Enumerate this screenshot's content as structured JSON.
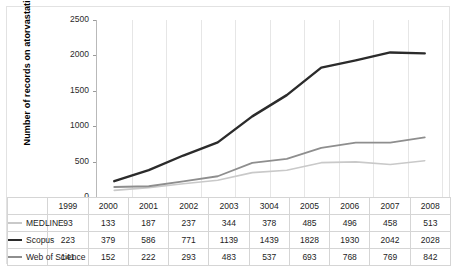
{
  "figure": {
    "background": "#ffffff",
    "border_color": "#e2e2e2"
  },
  "chart_data": {
    "type": "line",
    "title": "",
    "xlabel": "",
    "ylabel": "Number of records on atorvastatin",
    "categories": [
      "1999",
      "2000",
      "2001",
      "2002",
      "2003",
      "3004",
      "2005",
      "2006",
      "2007",
      "2008"
    ],
    "ylim": [
      0,
      2500
    ],
    "yticks": [
      0,
      500,
      1000,
      1500,
      2000,
      2500
    ],
    "ytick_labels": [
      "0",
      "500",
      "1000",
      "1500",
      "2000",
      "2500"
    ],
    "grid": false,
    "legend_position": "data-table-keys-left",
    "series": [
      {
        "name": "MEDLINE",
        "color": "#c9c9c9",
        "width": 1.6,
        "values": [
          93,
          133,
          187,
          237,
          344,
          378,
          485,
          496,
          458,
          513
        ]
      },
      {
        "name": "Scopus",
        "color": "#2b2b2b",
        "width": 2.4,
        "values": [
          223,
          379,
          586,
          771,
          1139,
          1439,
          1828,
          1930,
          2042,
          2028
        ]
      },
      {
        "name": "Web of Science",
        "color": "#8e8e8e",
        "width": 1.8,
        "values": [
          141,
          152,
          222,
          293,
          483,
          537,
          693,
          768,
          769,
          842
        ]
      }
    ]
  },
  "data_table": {
    "header_row": [
      "1999",
      "2000",
      "2001",
      "2002",
      "2003",
      "3004",
      "2005",
      "2006",
      "2007",
      "2008"
    ],
    "rows": [
      {
        "label": "MEDLINE",
        "values": [
          "93",
          "133",
          "187",
          "237",
          "344",
          "378",
          "485",
          "496",
          "458",
          "513"
        ]
      },
      {
        "label": "Scopus",
        "values": [
          "223",
          "379",
          "586",
          "771",
          "1139",
          "1439",
          "1828",
          "1930",
          "2042",
          "2028"
        ]
      },
      {
        "label": "Web of Science",
        "values": [
          "141",
          "152",
          "222",
          "293",
          "483",
          "537",
          "693",
          "768",
          "769",
          "842"
        ]
      }
    ]
  }
}
